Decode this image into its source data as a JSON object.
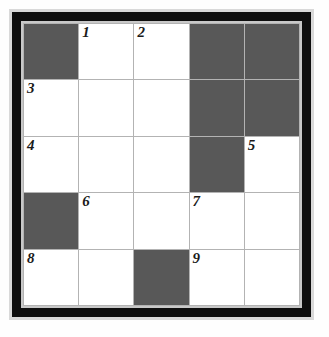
{
  "puzzle": {
    "type": "crossword-grid",
    "rows": 5,
    "columns": 5,
    "colors": {
      "shaded_cell": "#585858",
      "open_cell": "#ffffff",
      "grid_line": "#b3b3b3",
      "frame": "#0e0e0e",
      "bevel": "#c8c8c8",
      "outer_margin": "#d9d9d9",
      "number_text": "#1a1a1a"
    },
    "cells": [
      {
        "row": 1,
        "col": 1,
        "shaded": true,
        "number": ""
      },
      {
        "row": 1,
        "col": 2,
        "shaded": false,
        "number": "1"
      },
      {
        "row": 1,
        "col": 3,
        "shaded": false,
        "number": "2"
      },
      {
        "row": 1,
        "col": 4,
        "shaded": true,
        "number": ""
      },
      {
        "row": 1,
        "col": 5,
        "shaded": true,
        "number": ""
      },
      {
        "row": 2,
        "col": 1,
        "shaded": false,
        "number": "3"
      },
      {
        "row": 2,
        "col": 2,
        "shaded": false,
        "number": ""
      },
      {
        "row": 2,
        "col": 3,
        "shaded": false,
        "number": ""
      },
      {
        "row": 2,
        "col": 4,
        "shaded": true,
        "number": ""
      },
      {
        "row": 2,
        "col": 5,
        "shaded": true,
        "number": ""
      },
      {
        "row": 3,
        "col": 1,
        "shaded": false,
        "number": "4"
      },
      {
        "row": 3,
        "col": 2,
        "shaded": false,
        "number": ""
      },
      {
        "row": 3,
        "col": 3,
        "shaded": false,
        "number": ""
      },
      {
        "row": 3,
        "col": 4,
        "shaded": true,
        "number": ""
      },
      {
        "row": 3,
        "col": 5,
        "shaded": false,
        "number": "5"
      },
      {
        "row": 4,
        "col": 1,
        "shaded": true,
        "number": ""
      },
      {
        "row": 4,
        "col": 2,
        "shaded": false,
        "number": "6"
      },
      {
        "row": 4,
        "col": 3,
        "shaded": false,
        "number": ""
      },
      {
        "row": 4,
        "col": 4,
        "shaded": false,
        "number": "7"
      },
      {
        "row": 4,
        "col": 5,
        "shaded": false,
        "number": ""
      },
      {
        "row": 5,
        "col": 1,
        "shaded": false,
        "number": "8"
      },
      {
        "row": 5,
        "col": 2,
        "shaded": false,
        "number": ""
      },
      {
        "row": 5,
        "col": 3,
        "shaded": true,
        "number": ""
      },
      {
        "row": 5,
        "col": 4,
        "shaded": false,
        "number": "9"
      },
      {
        "row": 5,
        "col": 5,
        "shaded": false,
        "number": ""
      }
    ]
  }
}
